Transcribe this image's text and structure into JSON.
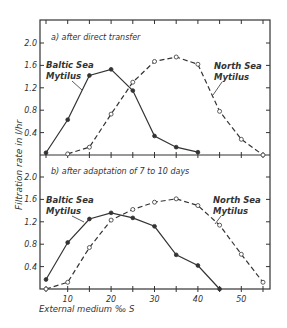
{
  "chart_data": [
    {
      "type": "line",
      "title": "a) after direct transfer",
      "xlabel": "External medium ‰ S",
      "ylabel": "Filtration rate in l/hr",
      "ylim": [
        0,
        2.4
      ],
      "xlim": [
        3,
        57
      ],
      "yticks": [
        "0.4",
        "0.8",
        "1.2",
        "1.6",
        "2.0"
      ],
      "series": [
        {
          "name": "Baltic Sea Mytilus",
          "marker": "filled",
          "line": "solid",
          "x": [
            5,
            10,
            15,
            20,
            25,
            30,
            35,
            40
          ],
          "values": [
            0.04,
            0.63,
            1.42,
            1.53,
            1.15,
            0.34,
            0.14,
            0.05
          ]
        },
        {
          "name": "North Sea Mytilus",
          "marker": "open",
          "line": "dashed",
          "x": [
            10,
            15,
            20,
            25,
            30,
            35,
            40,
            45,
            50,
            55
          ],
          "values": [
            0.02,
            0.14,
            0.73,
            1.3,
            1.67,
            1.75,
            1.62,
            0.78,
            0.28,
            0.0
          ]
        }
      ]
    },
    {
      "type": "line",
      "title": "b) after adaptation of 7 to 10 days",
      "xlabel": "External medium ‰ S",
      "ylabel": "Filtration rate in l/hr",
      "ylim": [
        0,
        2.4
      ],
      "xlim": [
        3,
        57
      ],
      "xticks": [
        "10",
        "20",
        "30",
        "40",
        "50"
      ],
      "yticks": [
        "0.4",
        "0.8",
        "1.2",
        "1.6",
        "2.0"
      ],
      "series": [
        {
          "name": "Baltic Sea Mytilus",
          "marker": "filled",
          "line": "solid",
          "x": [
            5,
            10,
            15,
            20,
            25,
            30,
            35,
            40,
            45
          ],
          "values": [
            0.17,
            0.83,
            1.25,
            1.36,
            1.27,
            1.12,
            0.61,
            0.42,
            0.0
          ]
        },
        {
          "name": "North Sea Mytilus",
          "marker": "open",
          "line": "dashed",
          "x": [
            5,
            10,
            15,
            20,
            25,
            30,
            35,
            40,
            45,
            50,
            55
          ],
          "values": [
            0.0,
            0.12,
            0.74,
            1.23,
            1.42,
            1.55,
            1.61,
            1.49,
            1.14,
            0.62,
            0.12
          ]
        }
      ]
    }
  ],
  "labels": {
    "panel_a_title": "a)  after direct transfer",
    "panel_b_title": "b)  after adaptation of 7 to 10 days",
    "baltic_line1": "Baltic Sea",
    "baltic_line2": "Mytilus",
    "north_line1": "North Sea",
    "north_line2": "Mytilus",
    "ylabel": "Filtration rate in l/hr",
    "xlabel": "External medium  ‰ S"
  },
  "colors": {
    "ink": "#333333",
    "background": "#ffffff"
  }
}
